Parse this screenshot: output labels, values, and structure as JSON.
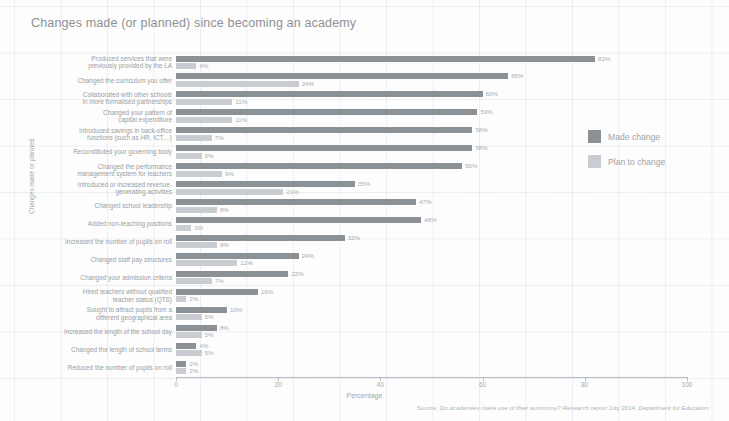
{
  "chart_data": {
    "type": "bar",
    "orientation": "horizontal",
    "title": "Changes made (or planned) since becoming an academy",
    "xlabel": "Percentage",
    "ylabel": "Changes made or planned",
    "xlim": [
      0,
      100
    ],
    "xticks": [
      0,
      20,
      40,
      60,
      80,
      100
    ],
    "xtick_labels": [
      "0",
      "20",
      "40",
      "60",
      "80",
      "100"
    ],
    "grid": true,
    "legend_position": "right",
    "categories": [
      "Produced services that were\npreviously provided by the LA",
      "Changed the curriculum you offer",
      "Collaborated with other schools\nin more formalised partnerships",
      "Changed your pattern of\ncapital expenditure",
      "Introduced savings in back-office\nfunctions (such as HR, ICT,...)",
      "Reconstituted your governing body",
      "Changed the performance\nmanagement system for teachers",
      "Introduced or increased revenue-\ngenerating activities",
      "Changed school leadership",
      "Added non-teaching positions",
      "Increased the number of pupils on roll",
      "Changed staff pay structures",
      "Changed your admission criteria",
      "Hired teachers without qualified\nteacher status (QTS)",
      "Sought to attract pupils from a\ndifferent geographical area",
      "Increased the length of the school day",
      "Changed the length of school terms",
      "Reduced the number of pupils on roll"
    ],
    "series": [
      {
        "name": "Made change",
        "color": "#8c9196",
        "values": [
          82,
          65,
          60,
          59,
          58,
          58,
          56,
          35,
          47,
          48,
          33,
          24,
          22,
          16,
          10,
          8,
          4,
          2
        ],
        "labels": [
          "82%",
          "65%",
          "60%",
          "59%",
          "58%",
          "58%",
          "56%",
          "35%",
          "47%",
          "48%",
          "33%",
          "24%",
          "22%",
          "16%",
          "10%",
          "8%",
          "4%",
          "2%"
        ]
      },
      {
        "name": "Plan to change",
        "color": "#c9cdd1",
        "values": [
          4,
          24,
          11,
          11,
          7,
          5,
          9,
          21,
          8,
          3,
          8,
          12,
          7,
          2,
          5,
          5,
          5,
          2
        ],
        "labels": [
          "4%",
          "24%",
          "11%",
          "11%",
          "7%",
          "5%",
          "9%",
          "21%",
          "8%",
          "3%",
          "8%",
          "12%",
          "7%",
          "2%",
          "5%",
          "5%",
          "5%",
          "2%"
        ]
      }
    ]
  },
  "legend": {
    "entries": [
      {
        "label": "Made change",
        "color": "#8c9196"
      },
      {
        "label": "Plan to change",
        "color": "#c9cdd1"
      }
    ]
  },
  "source": {
    "prefix": "Source: ",
    "report": "Do academies make use of their autonomy? Research report",
    "suffix": " July 2014, ",
    "publisher": "Department for Education"
  }
}
